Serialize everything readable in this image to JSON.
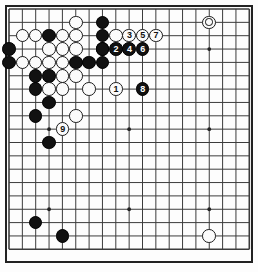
{
  "app": {
    "title": "Go Board Diagram",
    "board_size": 19,
    "colors": {
      "background": "#fdfdfd",
      "line": "#3c3c3c",
      "border": "#222222",
      "black_stone": "#111111",
      "white_stone": "#fbfbfb",
      "white_stone_edge": "#1a1a1a"
    }
  },
  "geometry": {
    "origin_x": 9,
    "origin_y": 9,
    "spacing": 13.35,
    "stone_diameter": 13.6,
    "border_x": 6,
    "border_y": 6,
    "border_w": 246,
    "border_h": 256
  },
  "star_points": [
    {
      "col": 3,
      "row": 3
    },
    {
      "col": 9,
      "row": 3
    },
    {
      "col": 15,
      "row": 3
    },
    {
      "col": 3,
      "row": 9
    },
    {
      "col": 9,
      "row": 9
    },
    {
      "col": 15,
      "row": 9
    },
    {
      "col": 3,
      "row": 15
    },
    {
      "col": 9,
      "row": 15
    },
    {
      "col": 15,
      "row": 15
    }
  ],
  "stones": [
    {
      "col": 5,
      "row": 1,
      "color": "white",
      "label": ""
    },
    {
      "col": 7,
      "row": 1,
      "color": "black",
      "label": ""
    },
    {
      "col": 1,
      "row": 2,
      "color": "white",
      "label": ""
    },
    {
      "col": 2,
      "row": 2,
      "color": "white",
      "label": ""
    },
    {
      "col": 3,
      "row": 2,
      "color": "black",
      "label": ""
    },
    {
      "col": 4,
      "row": 2,
      "color": "white",
      "label": ""
    },
    {
      "col": 5,
      "row": 2,
      "color": "white",
      "label": ""
    },
    {
      "col": 7,
      "row": 2,
      "color": "black",
      "label": ""
    },
    {
      "col": 0,
      "row": 3,
      "color": "black",
      "label": ""
    },
    {
      "col": 3,
      "row": 3,
      "color": "white",
      "label": ""
    },
    {
      "col": 4,
      "row": 3,
      "color": "white",
      "label": ""
    },
    {
      "col": 5,
      "row": 3,
      "color": "white",
      "label": ""
    },
    {
      "col": 7,
      "row": 3,
      "color": "black",
      "label": ""
    },
    {
      "col": 0,
      "row": 4,
      "color": "black",
      "label": ""
    },
    {
      "col": 1,
      "row": 4,
      "color": "white",
      "label": ""
    },
    {
      "col": 2,
      "row": 4,
      "color": "white",
      "label": ""
    },
    {
      "col": 3,
      "row": 4,
      "color": "white",
      "label": ""
    },
    {
      "col": 4,
      "row": 4,
      "color": "white",
      "label": ""
    },
    {
      "col": 5,
      "row": 4,
      "color": "black",
      "label": ""
    },
    {
      "col": 6,
      "row": 4,
      "color": "black",
      "label": ""
    },
    {
      "col": 7,
      "row": 4,
      "color": "black",
      "label": ""
    },
    {
      "col": 2,
      "row": 5,
      "color": "black",
      "label": ""
    },
    {
      "col": 3,
      "row": 5,
      "color": "black",
      "label": ""
    },
    {
      "col": 4,
      "row": 5,
      "color": "white",
      "label": ""
    },
    {
      "col": 5,
      "row": 5,
      "color": "white",
      "label": ""
    },
    {
      "col": 2,
      "row": 6,
      "color": "black",
      "label": ""
    },
    {
      "col": 3,
      "row": 6,
      "color": "white",
      "label": ""
    },
    {
      "col": 4,
      "row": 6,
      "color": "white",
      "label": ""
    },
    {
      "col": 6,
      "row": 6,
      "color": "white",
      "label": ""
    },
    {
      "col": 3,
      "row": 7,
      "color": "black",
      "label": ""
    },
    {
      "col": 2,
      "row": 8,
      "color": "black",
      "label": ""
    },
    {
      "col": 5,
      "row": 8,
      "color": "white",
      "label": ""
    },
    {
      "col": 3,
      "row": 10,
      "color": "black",
      "label": ""
    },
    {
      "col": 2,
      "row": 16,
      "color": "black",
      "label": ""
    },
    {
      "col": 4,
      "row": 17,
      "color": "black",
      "label": ""
    },
    {
      "col": 15,
      "row": 17,
      "color": "white",
      "label": ""
    },
    {
      "col": 15,
      "row": 1,
      "color": "white",
      "label": "",
      "mark": "circle"
    },
    {
      "col": 8,
      "row": 2,
      "color": "white",
      "label": ""
    },
    {
      "col": 9,
      "row": 2,
      "color": "white",
      "label": "3"
    },
    {
      "col": 10,
      "row": 2,
      "color": "white",
      "label": "5"
    },
    {
      "col": 11,
      "row": 2,
      "color": "white",
      "label": "7"
    },
    {
      "col": 7,
      "row": 3,
      "color": "black",
      "label": ""
    },
    {
      "col": 8,
      "row": 3,
      "color": "black",
      "label": "2"
    },
    {
      "col": 9,
      "row": 3,
      "color": "black",
      "label": "4"
    },
    {
      "col": 10,
      "row": 3,
      "color": "black",
      "label": "6"
    },
    {
      "col": 8,
      "row": 6,
      "color": "white",
      "label": "1"
    },
    {
      "col": 10,
      "row": 6,
      "color": "black",
      "label": "8"
    },
    {
      "col": 4,
      "row": 9,
      "color": "white",
      "label": "9"
    }
  ],
  "move_sequence": [
    {
      "number": 1,
      "color": "white"
    },
    {
      "number": 2,
      "color": "black"
    },
    {
      "number": 3,
      "color": "white"
    },
    {
      "number": 4,
      "color": "black"
    },
    {
      "number": 5,
      "color": "white"
    },
    {
      "number": 6,
      "color": "black"
    },
    {
      "number": 7,
      "color": "white"
    },
    {
      "number": 8,
      "color": "black"
    },
    {
      "number": 9,
      "color": "white"
    }
  ]
}
